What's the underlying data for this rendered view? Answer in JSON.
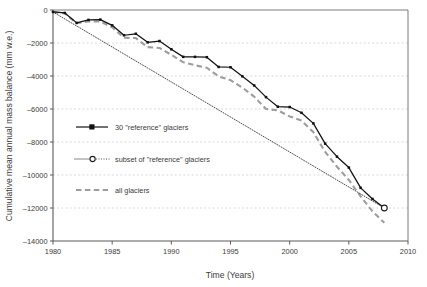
{
  "chart_data": {
    "type": "line",
    "title": "",
    "xlabel": "Time (Years)",
    "ylabel": "Cumulative mean annual mass balance (mm w.e.)",
    "xlim": [
      1980,
      2010
    ],
    "ylim": [
      -14000,
      0
    ],
    "xticks": [
      1980,
      1985,
      1990,
      1995,
      2000,
      2005,
      2010
    ],
    "xtick_labels": [
      "1980",
      "1985",
      "1990",
      "1995",
      "2000",
      "2005",
      "2010"
    ],
    "yticks": [
      0,
      -2000,
      -4000,
      -6000,
      -8000,
      -10000,
      -12000,
      -14000
    ],
    "ytick_labels": [
      "0",
      "–2000",
      "–4000",
      "–6000",
      "–8000",
      "–10000",
      "–12000",
      "–14000"
    ],
    "grid": "horizontal-dashed",
    "legend_position": "inside-left-middle",
    "x": [
      1980,
      1981,
      1982,
      1983,
      1984,
      1985,
      1986,
      1987,
      1988,
      1989,
      1990,
      1991,
      1992,
      1993,
      1994,
      1995,
      1996,
      1997,
      1998,
      1999,
      2000,
      2001,
      2002,
      2003,
      2004,
      2005,
      2006,
      2007,
      2008
    ],
    "series": [
      {
        "name": "30 \"reference\" glaciers",
        "style": "solid-black-square-markers",
        "color": "#111111",
        "values": [
          -120,
          -180,
          -780,
          -600,
          -580,
          -930,
          -1530,
          -1440,
          -1960,
          -1880,
          -2380,
          -2840,
          -2840,
          -2860,
          -3450,
          -3470,
          -4020,
          -4570,
          -5280,
          -5860,
          -5880,
          -6230,
          -6870,
          -8100,
          -8890,
          -9550,
          -10780,
          -11450,
          -12000
        ]
      },
      {
        "name": "subset of \"reference\" glaciers",
        "style": "thin-solid-dotted-open-circle",
        "color": "#2a2a2a",
        "values": [
          -120,
          null,
          null,
          null,
          null,
          null,
          null,
          null,
          null,
          null,
          null,
          null,
          null,
          null,
          null,
          null,
          null,
          null,
          null,
          null,
          null,
          null,
          null,
          null,
          null,
          null,
          null,
          null,
          -12000
        ]
      },
      {
        "name": "all glaciers",
        "style": "gray-dashed",
        "color": "#9d9d9d",
        "values": [
          -120,
          -200,
          -800,
          -700,
          -700,
          -1050,
          -1680,
          -1700,
          -2250,
          -2300,
          -2720,
          -3160,
          -3350,
          -3500,
          -4030,
          -4250,
          -4700,
          -5250,
          -6000,
          -6080,
          -6450,
          -6700,
          -7400,
          -8600,
          -9500,
          -10300,
          -11300,
          -12200,
          -12900
        ]
      }
    ]
  },
  "legend": {
    "items": [
      {
        "label": "30 \"reference\" glaciers",
        "marker": "filled-square-solid-line"
      },
      {
        "label": "subset of \"reference\" glaciers",
        "marker": "open-circle-dotted-line"
      },
      {
        "label": "all glaciers",
        "marker": "gray-dashed-line"
      }
    ]
  },
  "colors": {
    "reference": "#111111",
    "subset": "#2a2a2a",
    "all": "#9d9d9d",
    "grid": "#c9c9c9",
    "axis": "#5a5a5a",
    "background": "#ffffff"
  }
}
